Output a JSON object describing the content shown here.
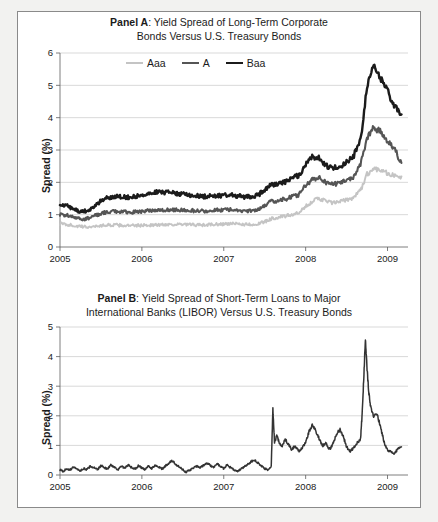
{
  "figure": {
    "background": "#f2f2f0",
    "card_background": "#ffffff",
    "border_color": "#8a8a8a"
  },
  "panel_a": {
    "label": "Panel A",
    "title_line1": ": Yield Spread of Long-Term Corporate",
    "title_line2": "Bonds Versus U.S. Treasury Bonds",
    "ylabel": "Spread (%)"
  },
  "panel_b": {
    "label": "Panel B",
    "title_line1": ": Yield Spread of Short-Term Loans to Major",
    "title_line2": "International Banks (LIBOR) Versus U.S. Treasury Bonds",
    "ylabel": "Spread (%)"
  },
  "chart_data": [
    {
      "type": "line",
      "title": "Panel A: Yield Spread of Long-Term Corporate Bonds Versus U.S. Treasury Bonds",
      "xlabel": "",
      "ylabel": "Spread (%)",
      "xlim": [
        2005.0,
        2009.25
      ],
      "ylim": [
        0,
        6
      ],
      "yticks": [
        0,
        1,
        2,
        3,
        4,
        5,
        6
      ],
      "xticks": [
        2005,
        2006,
        2007,
        2008,
        2009
      ],
      "xtick_labels": [
        "2005",
        "2006",
        "2007",
        "2008",
        "2009"
      ],
      "grid": true,
      "legend_position": "top-center",
      "series": [
        {
          "name": "Aaa",
          "color": "#c4c4c4",
          "width": 1.9,
          "x": [
            2005.0,
            2005.08,
            2005.17,
            2005.25,
            2005.33,
            2005.42,
            2005.5,
            2005.58,
            2005.67,
            2005.75,
            2005.83,
            2005.92,
            2006.0,
            2006.08,
            2006.17,
            2006.25,
            2006.33,
            2006.42,
            2006.5,
            2006.58,
            2006.67,
            2006.75,
            2006.83,
            2006.92,
            2007.0,
            2007.08,
            2007.17,
            2007.25,
            2007.33,
            2007.42,
            2007.5,
            2007.58,
            2007.67,
            2007.75,
            2007.83,
            2007.92,
            2008.0,
            2008.08,
            2008.17,
            2008.25,
            2008.33,
            2008.42,
            2008.5,
            2008.58,
            2008.67,
            2008.75,
            2008.83,
            2008.92,
            2009.0,
            2009.08,
            2009.17
          ],
          "y": [
            0.72,
            0.7,
            0.66,
            0.63,
            0.62,
            0.64,
            0.66,
            0.68,
            0.68,
            0.67,
            0.66,
            0.66,
            0.67,
            0.68,
            0.68,
            0.69,
            0.7,
            0.7,
            0.69,
            0.69,
            0.68,
            0.68,
            0.69,
            0.7,
            0.71,
            0.72,
            0.71,
            0.7,
            0.7,
            0.71,
            0.78,
            0.88,
            0.92,
            0.95,
            1.0,
            1.05,
            1.25,
            1.42,
            1.5,
            1.42,
            1.36,
            1.4,
            1.46,
            1.52,
            1.75,
            2.25,
            2.42,
            2.4,
            2.28,
            2.2,
            2.18
          ]
        },
        {
          "name": "A",
          "color": "#555555",
          "width": 2.1,
          "x": [
            2005.0,
            2005.08,
            2005.17,
            2005.25,
            2005.33,
            2005.42,
            2005.5,
            2005.58,
            2005.67,
            2005.75,
            2005.83,
            2005.92,
            2006.0,
            2006.08,
            2006.17,
            2006.25,
            2006.33,
            2006.42,
            2006.5,
            2006.58,
            2006.67,
            2006.75,
            2006.83,
            2006.92,
            2007.0,
            2007.08,
            2007.17,
            2007.25,
            2007.33,
            2007.42,
            2007.5,
            2007.58,
            2007.67,
            2007.75,
            2007.83,
            2007.92,
            2008.0,
            2008.08,
            2008.17,
            2008.25,
            2008.33,
            2008.42,
            2008.5,
            2008.58,
            2008.67,
            2008.75,
            2008.83,
            2008.92,
            2009.0,
            2009.08,
            2009.17
          ],
          "y": [
            1.0,
            0.98,
            0.92,
            0.86,
            0.88,
            0.96,
            1.04,
            1.08,
            1.1,
            1.09,
            1.08,
            1.08,
            1.1,
            1.12,
            1.14,
            1.15,
            1.16,
            1.15,
            1.14,
            1.13,
            1.12,
            1.11,
            1.12,
            1.14,
            1.15,
            1.16,
            1.14,
            1.12,
            1.12,
            1.16,
            1.28,
            1.4,
            1.44,
            1.48,
            1.55,
            1.62,
            1.9,
            2.08,
            2.12,
            2.0,
            1.94,
            1.98,
            2.06,
            2.16,
            2.55,
            3.35,
            3.7,
            3.55,
            3.3,
            3.05,
            2.6
          ]
        },
        {
          "name": "Baa",
          "color": "#1b1b1b",
          "width": 2.4,
          "x": [
            2005.0,
            2005.08,
            2005.17,
            2005.25,
            2005.33,
            2005.42,
            2005.5,
            2005.58,
            2005.67,
            2005.75,
            2005.83,
            2005.92,
            2006.0,
            2006.08,
            2006.17,
            2006.25,
            2006.33,
            2006.42,
            2006.5,
            2006.58,
            2006.67,
            2006.75,
            2006.83,
            2006.92,
            2007.0,
            2007.08,
            2007.17,
            2007.25,
            2007.33,
            2007.42,
            2007.5,
            2007.58,
            2007.67,
            2007.75,
            2007.83,
            2007.92,
            2008.0,
            2008.08,
            2008.17,
            2008.25,
            2008.33,
            2008.42,
            2008.5,
            2008.58,
            2008.67,
            2008.75,
            2008.83,
            2008.92,
            2009.0,
            2009.08,
            2009.17
          ],
          "y": [
            1.32,
            1.28,
            1.18,
            1.08,
            1.12,
            1.26,
            1.44,
            1.52,
            1.56,
            1.55,
            1.54,
            1.56,
            1.6,
            1.66,
            1.7,
            1.7,
            1.68,
            1.66,
            1.63,
            1.6,
            1.58,
            1.56,
            1.57,
            1.58,
            1.6,
            1.61,
            1.58,
            1.55,
            1.55,
            1.6,
            1.78,
            1.92,
            1.98,
            2.02,
            2.12,
            2.22,
            2.56,
            2.8,
            2.76,
            2.52,
            2.42,
            2.5,
            2.62,
            2.78,
            3.3,
            4.95,
            5.6,
            5.2,
            4.85,
            4.35,
            4.1
          ]
        }
      ]
    },
    {
      "type": "line",
      "title": "Panel B: Yield Spread of Short-Term Loans to Major International Banks (LIBOR) Versus U.S. Treasury Bonds",
      "xlabel": "",
      "ylabel": "Spread (%)",
      "xlim": [
        2005.0,
        2009.25
      ],
      "ylim": [
        0,
        5
      ],
      "yticks": [
        0,
        1,
        2,
        3,
        4,
        5
      ],
      "xticks": [
        2005,
        2006,
        2007,
        2008,
        2009
      ],
      "xtick_labels": [
        "2005",
        "2006",
        "2007",
        "2008",
        "2009"
      ],
      "grid": true,
      "legend_position": "none",
      "series": [
        {
          "name": "LIBOR spread",
          "color": "#333333",
          "width": 1.5,
          "x": [
            2005.0,
            2005.04,
            2005.08,
            2005.12,
            2005.17,
            2005.21,
            2005.25,
            2005.29,
            2005.33,
            2005.37,
            2005.42,
            2005.46,
            2005.5,
            2005.54,
            2005.58,
            2005.62,
            2005.67,
            2005.71,
            2005.75,
            2005.79,
            2005.83,
            2005.87,
            2005.92,
            2005.96,
            2006.0,
            2006.04,
            2006.08,
            2006.12,
            2006.17,
            2006.21,
            2006.25,
            2006.29,
            2006.33,
            2006.37,
            2006.42,
            2006.46,
            2006.5,
            2006.54,
            2006.58,
            2006.62,
            2006.67,
            2006.71,
            2006.75,
            2006.79,
            2006.83,
            2006.87,
            2006.92,
            2006.96,
            2007.0,
            2007.04,
            2007.08,
            2007.12,
            2007.17,
            2007.21,
            2007.25,
            2007.29,
            2007.33,
            2007.37,
            2007.42,
            2007.46,
            2007.5,
            2007.54,
            2007.58,
            2007.6,
            2007.62,
            2007.65,
            2007.67,
            2007.71,
            2007.75,
            2007.79,
            2007.83,
            2007.87,
            2007.92,
            2007.96,
            2008.0,
            2008.04,
            2008.08,
            2008.12,
            2008.17,
            2008.21,
            2008.25,
            2008.29,
            2008.33,
            2008.37,
            2008.42,
            2008.46,
            2008.5,
            2008.54,
            2008.58,
            2008.62,
            2008.67,
            2008.69,
            2008.71,
            2008.73,
            2008.75,
            2008.77,
            2008.79,
            2008.83,
            2008.87,
            2008.92,
            2008.96,
            2009.0,
            2009.04,
            2009.08,
            2009.12,
            2009.17
          ],
          "y": [
            0.18,
            0.12,
            0.22,
            0.16,
            0.28,
            0.2,
            0.14,
            0.22,
            0.18,
            0.3,
            0.24,
            0.18,
            0.32,
            0.26,
            0.2,
            0.34,
            0.26,
            0.18,
            0.3,
            0.22,
            0.34,
            0.26,
            0.2,
            0.32,
            0.24,
            0.18,
            0.3,
            0.22,
            0.34,
            0.26,
            0.2,
            0.32,
            0.4,
            0.48,
            0.34,
            0.26,
            0.18,
            0.1,
            0.16,
            0.22,
            0.3,
            0.24,
            0.32,
            0.4,
            0.34,
            0.26,
            0.38,
            0.3,
            0.22,
            0.34,
            0.26,
            0.18,
            0.12,
            0.2,
            0.28,
            0.36,
            0.44,
            0.52,
            0.4,
            0.3,
            0.22,
            0.16,
            0.3,
            2.25,
            1.1,
            1.35,
            1.15,
            0.95,
            1.2,
            1.05,
            0.85,
            1.0,
            0.78,
            0.92,
            1.12,
            1.45,
            1.68,
            1.52,
            1.2,
            0.98,
            1.1,
            0.85,
            1.02,
            1.35,
            1.55,
            1.3,
            0.95,
            0.8,
            0.9,
            1.05,
            1.2,
            2.05,
            3.3,
            4.6,
            3.6,
            2.8,
            2.35,
            1.95,
            2.1,
            1.55,
            1.1,
            0.85,
            0.78,
            0.72,
            0.85,
            0.95
          ]
        }
      ]
    }
  ]
}
